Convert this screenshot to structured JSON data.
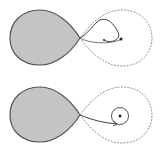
{
  "diagram": {
    "colors": {
      "lobe_fill": "#c4c4c4",
      "lobe_stroke": "#555555",
      "dashed_lobe": "#777777",
      "stream": "#444444",
      "background": "#ffffff"
    },
    "panels": [
      {
        "name": "top",
        "stream_shape": "loop returning near the companion",
        "has_accretion_disk": false
      },
      {
        "name": "bottom",
        "stream_shape": "stream feeding a ring around the companion",
        "has_accretion_disk": true
      }
    ]
  }
}
